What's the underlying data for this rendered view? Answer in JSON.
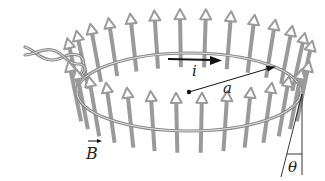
{
  "figure": {
    "labels": {
      "current": "i",
      "radius": "a",
      "field": "B",
      "field_vector_arrow": "→",
      "angle": "θ"
    },
    "colors": {
      "field_arrows": "#9a9a9a",
      "field_arrow_head_fill": "#ffffff",
      "wire": "#8a8a8a",
      "wire_highlight": "#e0e0e0",
      "ink": "#111111"
    },
    "loop": {
      "cx": 189,
      "cy": 92,
      "rx": 112,
      "ry": 39
    },
    "field_arrow_count_back": 14,
    "field_arrow_count_front": 14
  }
}
